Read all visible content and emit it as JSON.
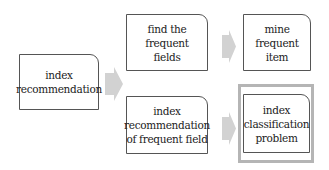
{
  "diagram": {
    "nodes": [
      {
        "id": "index-recommendation",
        "label": "index\nrecommendation"
      },
      {
        "id": "find-frequent-fields",
        "label": "find the frequent\nfields"
      },
      {
        "id": "mine-frequent-item",
        "label": "mine\nfrequent item"
      },
      {
        "id": "index-recommendation-frequent-field",
        "label": "index\nrecommendation\nof frequent field"
      },
      {
        "id": "index-classification-problem",
        "label": "index\nclassification\nproblem",
        "highlighted": true
      }
    ],
    "edges": [
      {
        "from": "index-recommendation",
        "to": [
          "find-frequent-fields",
          "index-recommendation-frequent-field"
        ]
      },
      {
        "from": "find-frequent-fields",
        "to": "mine-frequent-item"
      },
      {
        "from": "index-recommendation-frequent-field",
        "to": "index-classification-problem"
      }
    ],
    "colors": {
      "arrow": "#d2d2d2",
      "highlight_frame": "#b5b5b5",
      "border": "#555555"
    }
  }
}
